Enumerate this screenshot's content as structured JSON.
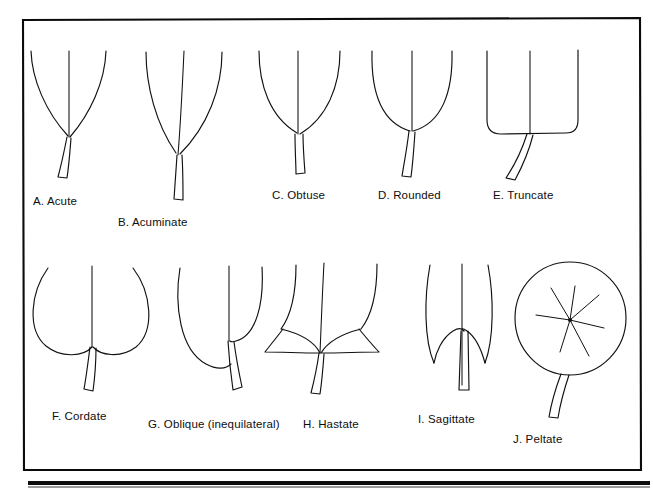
{
  "figure": {
    "ink_color": "#111111",
    "background_color": "#ffffff",
    "frame_color": "#0b0b0b",
    "rule_color": "#0d0d0d"
  },
  "rows": [
    {
      "name": "top-row",
      "items": [
        {
          "key": "acute",
          "letter": "A",
          "term": "Acute",
          "label": "A. Acute",
          "label_x": 33,
          "label_y": 196
        },
        {
          "key": "acuminate",
          "letter": "B",
          "term": "Acuminate",
          "label": "B. Acuminate",
          "label_x": 118,
          "label_y": 217
        },
        {
          "key": "obtuse",
          "letter": "C",
          "term": "Obtuse",
          "label": "C. Obtuse",
          "label_x": 272,
          "label_y": 190
        },
        {
          "key": "rounded",
          "letter": "D",
          "term": "Rounded",
          "label": "D. Rounded",
          "label_x": 378,
          "label_y": 190
        },
        {
          "key": "truncate",
          "letter": "E",
          "term": "Truncate",
          "label": "E. Truncate",
          "label_x": 493,
          "label_y": 190
        }
      ]
    },
    {
      "name": "bottom-row",
      "items": [
        {
          "key": "cordate",
          "letter": "F",
          "term": "Cordate",
          "label": "F. Cordate",
          "label_x": 52,
          "label_y": 411
        },
        {
          "key": "oblique",
          "letter": "G",
          "term": "Oblique (inequilateral)",
          "label": "G. Oblique (inequilateral)",
          "label_x": 148,
          "label_y": 419
        },
        {
          "key": "hastate",
          "letter": "H",
          "term": "Hastate",
          "label": "H. Hastate",
          "label_x": 303,
          "label_y": 419
        },
        {
          "key": "sagittate",
          "letter": "I",
          "term": "Sagittate",
          "label": "I. Sagittate",
          "label_x": 418,
          "label_y": 414
        },
        {
          "key": "peltate",
          "letter": "J",
          "term": "Peltate",
          "label": "J. Peltate",
          "label_x": 513,
          "label_y": 434
        }
      ]
    }
  ]
}
